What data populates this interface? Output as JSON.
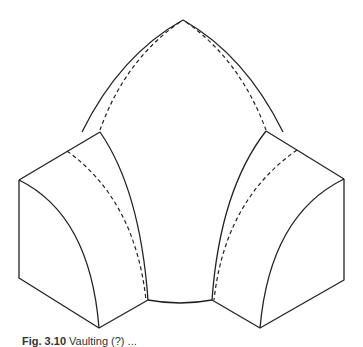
{
  "figure": {
    "stroke_color": "#222222",
    "background": "#ffffff"
  },
  "caption": {
    "label": "Fig. 3.10",
    "text": "Vaulting (?) ..."
  }
}
